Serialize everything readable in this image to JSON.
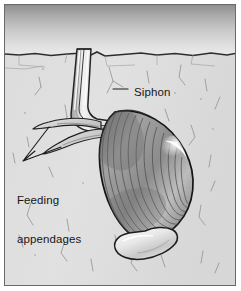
{
  "figure": {
    "border_color": "#6a6a6a",
    "background_color": "#ffffff"
  },
  "scene": {
    "water": {
      "name": "water-column",
      "gradient_top_color": "#9a9a9a",
      "gradient_bottom_color": "#e9e9e9",
      "top_y": 5,
      "bottom_y": 53
    },
    "sediment": {
      "name": "sediment-bed",
      "fill_color": "#dcdcdc",
      "surface_line_color": "#2b2b2b",
      "surface_y": 53,
      "bottom_y": 285
    },
    "organism": {
      "name": "clam",
      "shell_fill_color": "#b6b6b6",
      "shell_outline_color": "#1c1c1c",
      "shell_highlight_color": "#f2f2f2",
      "growth_line_color": "#5d5d5d",
      "siphon_fill_color": "#efefef",
      "siphon_outline_color": "#262626",
      "foot_fill_color": "#e6e6e6",
      "appendage_fill_color": "#dcdcdc"
    }
  },
  "labels": [
    {
      "id": "siphon",
      "text": "Siphon",
      "x": 129,
      "y": 81,
      "leader": {
        "from_x": 112,
        "from_y": 88,
        "to_x": 127,
        "to_y": 88
      }
    },
    {
      "id": "feeding-appendages",
      "line1": "Feeding",
      "line2": "appendages",
      "x": 12,
      "y": 163,
      "leader_tip_x": 22,
      "leader_tip_y": 160
    }
  ],
  "colors": {
    "ink": "#161616",
    "panel_border": "#6a6a6a",
    "water_top": "#9a9a9a",
    "water_bottom": "#e9e9e9",
    "sediment": "#dcdcdc"
  }
}
